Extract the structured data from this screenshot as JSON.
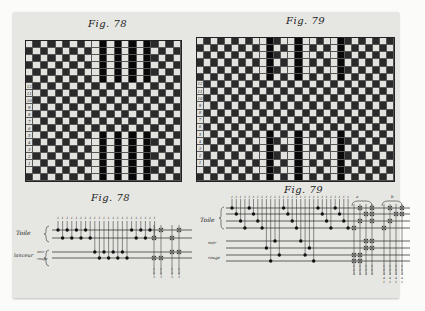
{
  "page": {
    "background": "#fbfbfa",
    "paper_color": "#e6e6e2"
  },
  "figures": {
    "fig78_grid": {
      "title": "Fig. 78",
      "cols": 21,
      "rows": 20,
      "stripe_cols": [
        9,
        10,
        11,
        12,
        13,
        14,
        15,
        16
      ],
      "stripe_rows_top": [
        0,
        1,
        2,
        3,
        4,
        5
      ],
      "stripe_rows_bottom": [
        13,
        14,
        15,
        16,
        17,
        18,
        19
      ],
      "row_numbers": [
        "12",
        "11",
        "10",
        "9",
        "8",
        "7",
        "6",
        "5",
        "4",
        "3",
        "2",
        "1"
      ]
    },
    "fig79_grid": {
      "title": "Fig. 79",
      "cols": 28,
      "rows": 20,
      "stripe_cols": [
        9,
        10,
        13,
        14,
        15,
        19,
        20
      ],
      "stripe_rows_top": [
        0,
        1,
        2,
        3,
        4,
        5
      ],
      "stripe_rows_bottom": [
        13,
        14,
        15,
        16,
        17,
        18,
        19
      ],
      "row_numbers": [
        "12",
        "11",
        "10",
        "9",
        "8",
        "7",
        "6",
        "5",
        "4",
        "3",
        "2",
        "1"
      ]
    },
    "fig78_diagram": {
      "title": "Fig. 78",
      "labels": {
        "toile": "Toile",
        "lanceur": "lanceur",
        "noir": "noir",
        "rouge": "rouge"
      },
      "shaft_numbers": [
        "1",
        "2",
        "3",
        "4"
      ]
    },
    "fig79_diagram": {
      "title": "Fig. 79",
      "labels": {
        "toile": "Toile",
        "noir": "noir",
        "rouge": "rouge"
      },
      "group_labels": [
        "a",
        "b"
      ],
      "shaft_numbers": [
        "1",
        "2",
        "3",
        "4"
      ]
    }
  }
}
